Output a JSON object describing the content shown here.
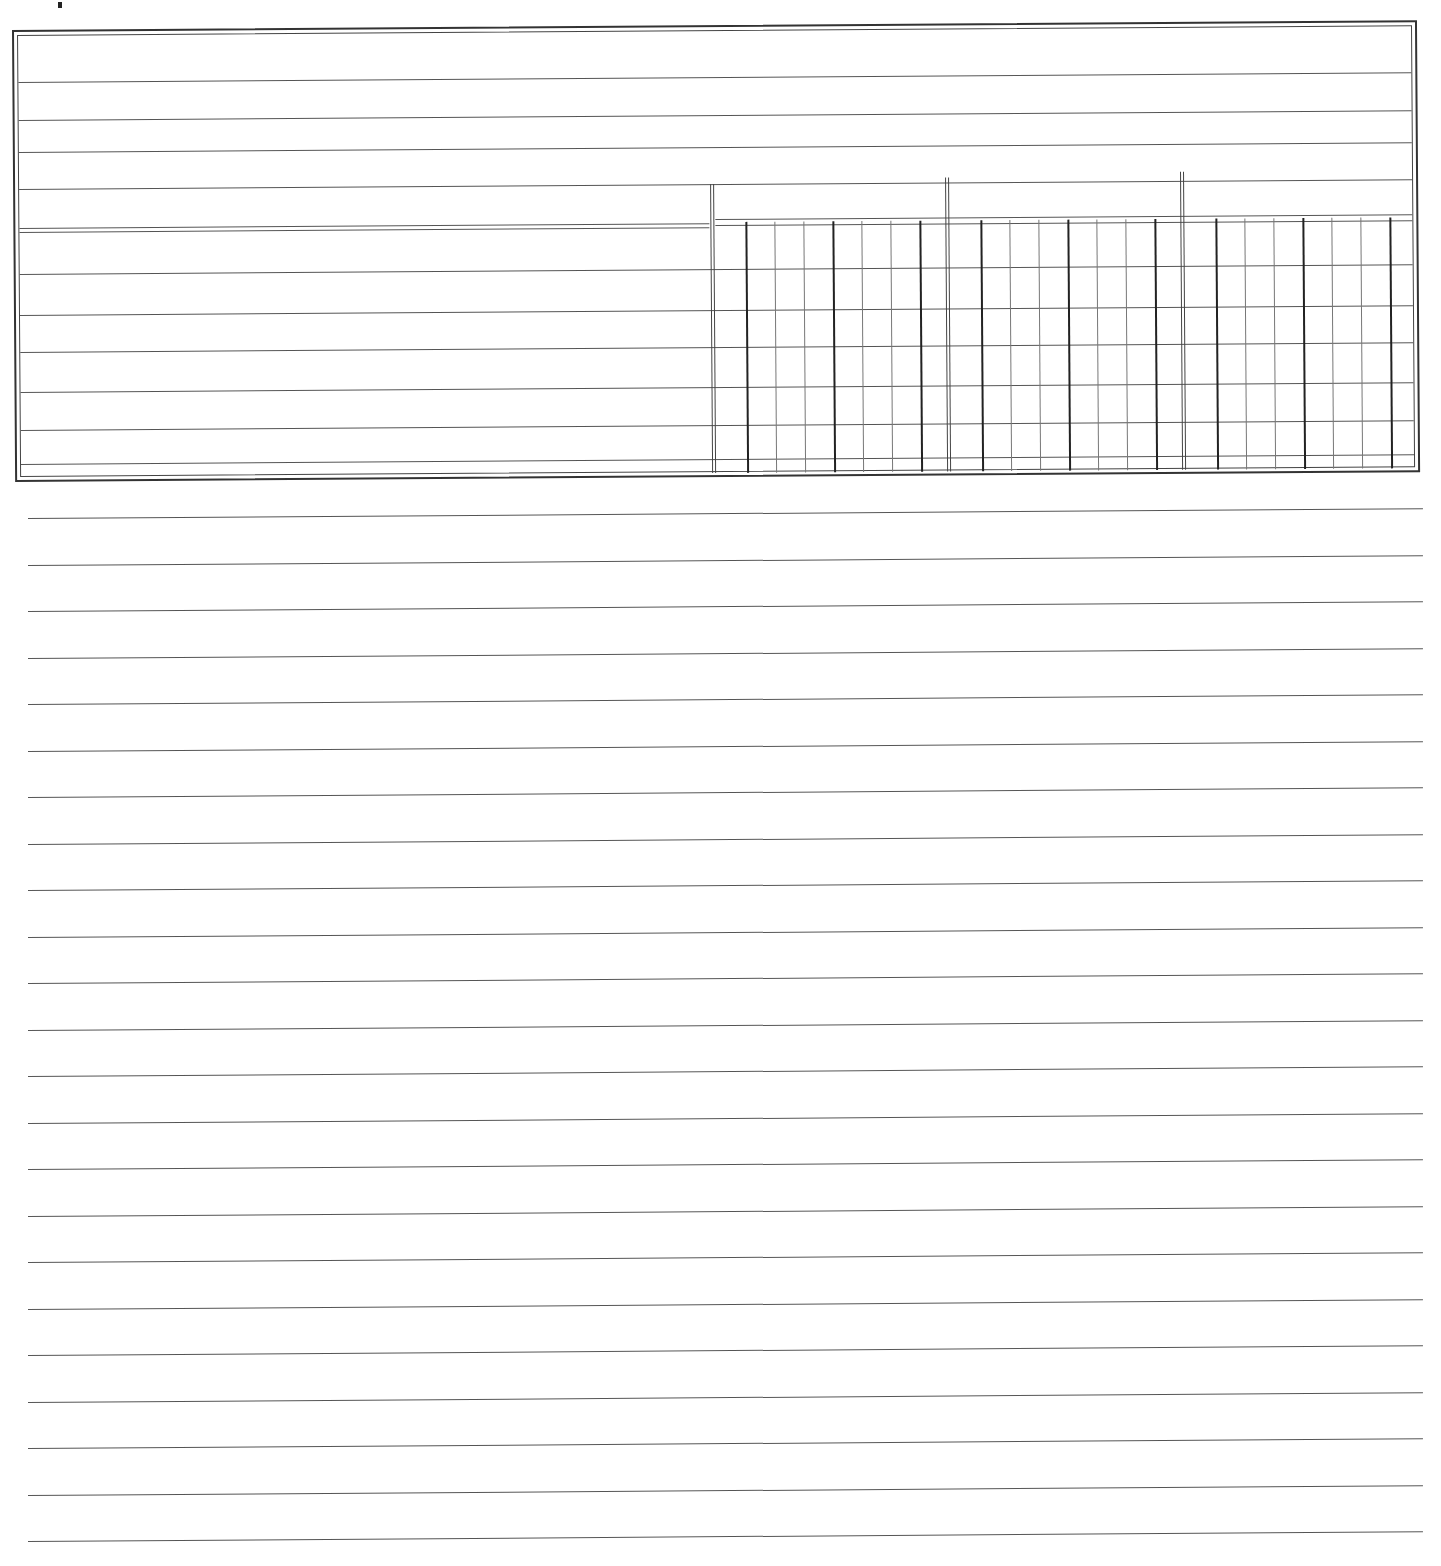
{
  "document": {
    "type": "blank ruled ledger form",
    "header_table": {
      "full_width_rows": 5,
      "body_rows": 6,
      "column_groups": 3,
      "subcolumns_per_group": 6,
      "cells": []
    },
    "ruled_lines": 23,
    "line_color": "#555555",
    "background": "#ffffff"
  }
}
